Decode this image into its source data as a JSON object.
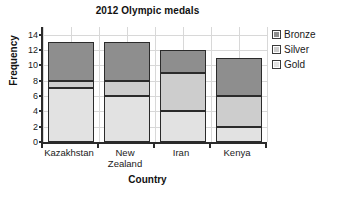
{
  "chart_data": {
    "type": "bar",
    "subtype": "stacked-bar",
    "title": "2012 Olympic medals",
    "xlabel": "Country",
    "ylabel": "Frequency",
    "categories": [
      "Kazakhstan",
      "New Zealand",
      "Iran",
      "Kenya"
    ],
    "series": [
      {
        "name": "Gold",
        "values": [
          7,
          6,
          4,
          2
        ],
        "color": "#e2e2e2"
      },
      {
        "name": "Silver",
        "values": [
          1,
          2,
          5,
          4
        ],
        "color": "#cdcdcd"
      },
      {
        "name": "Bronze",
        "values": [
          5,
          5,
          3,
          5
        ],
        "color": "#8e8e8e"
      }
    ],
    "totals": [
      13,
      13,
      12,
      11
    ],
    "ylim": [
      0,
      15
    ],
    "yticks": [
      0,
      2,
      4,
      6,
      8,
      10,
      12,
      14
    ],
    "ytick_labels": [
      "0",
      "2",
      "4",
      "6",
      "8",
      "10",
      "12",
      "14"
    ],
    "grid": true,
    "grid_axis": "both",
    "legend_position": "right",
    "legend_order": [
      "Bronze",
      "Silver",
      "Gold"
    ],
    "stack_order_bottom_to_top": [
      "Gold",
      "Silver",
      "Bronze"
    ]
  },
  "legend": {
    "items": [
      {
        "label": "Bronze",
        "color": "#8e8e8e"
      },
      {
        "label": "Silver",
        "color": "#cdcdcd"
      },
      {
        "label": "Gold",
        "color": "#e2e2e2"
      }
    ]
  },
  "axes": {
    "x_categories": [
      "Kazakhstan",
      "New Zealand",
      "Iran",
      "Kenya"
    ],
    "x_category_lines": [
      [
        "Kazakhstan"
      ],
      [
        "New",
        "Zealand"
      ],
      [
        "Iran"
      ],
      [
        "Kenya"
      ]
    ]
  }
}
